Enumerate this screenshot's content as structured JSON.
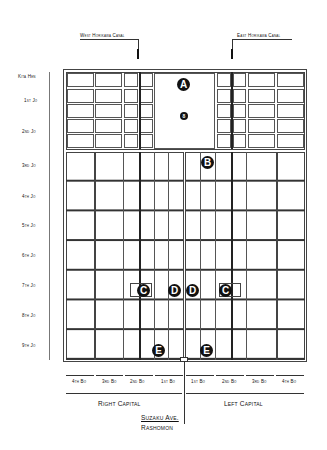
{
  "canals": {
    "west": "West Horikawa Canal",
    "east": "East Horikawa Canal"
  },
  "rows": [
    "Kita Hen",
    "1st Jo",
    "2nd Jo",
    "3rd Jo",
    "4th Jo",
    "5th Jo",
    "6th Jo",
    "7th Jo",
    "8th Jo",
    "9th Jo"
  ],
  "columns": {
    "right_capital": [
      "4th Bo",
      "3rd Bo",
      "2nd Bo",
      "1st Bo"
    ],
    "left_capital": [
      "1st Bo",
      "2nd Bo",
      "3rd Bo",
      "4th Bo"
    ]
  },
  "sections": {
    "right": "Right Capital",
    "left": "Left Capital"
  },
  "avenue": {
    "name": "Suzaku Ave.",
    "gate": "Rashomon"
  },
  "markers": {
    "A": "A",
    "palace_small": "8",
    "B": "B",
    "C": "C",
    "D": "D",
    "E": "E"
  },
  "colors": {
    "ink": "#111111",
    "grid": "#555555",
    "background": "#ffffff"
  }
}
